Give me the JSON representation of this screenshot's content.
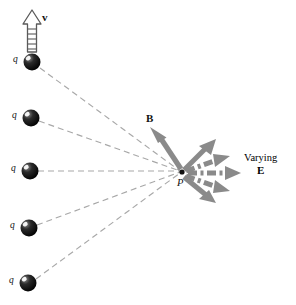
{
  "figure": {
    "title_visible": false,
    "background": "#ffffff",
    "width": 296,
    "height": 305,
    "colors": {
      "charge_fill": "#0a0a0a",
      "charge_highlight": "#ffffff",
      "dashed_line": "#a8a8a8",
      "field_arrow": "#8a8a8a",
      "b_arrow": "#8a8a8a",
      "velocity_arrow_stroke": "#555555",
      "text": "#111111"
    }
  },
  "labels": {
    "velocity": "v",
    "magnetic_field": "B",
    "point": "P",
    "varying_line1": "Varying",
    "varying_line2": "E",
    "charge": "q"
  },
  "charges": [
    {
      "label": "q",
      "cx": 32,
      "cy": 62,
      "r": 8.5,
      "label_x": 14,
      "label_y": 57
    },
    {
      "label": "q",
      "cx": 31,
      "cy": 118,
      "r": 8.5,
      "label_x": 13,
      "label_y": 113
    },
    {
      "label": "q",
      "cx": 30,
      "cy": 171,
      "r": 8.5,
      "label_x": 12,
      "label_y": 166
    },
    {
      "label": "q",
      "cx": 29,
      "cy": 228,
      "r": 8.5,
      "label_x": 11,
      "label_y": 223
    },
    {
      "label": "q",
      "cx": 28,
      "cy": 283,
      "r": 8.5,
      "label_x": 10,
      "label_y": 278
    }
  ],
  "observation_point": {
    "label": "P",
    "x": 183,
    "y": 172,
    "label_x": 178,
    "label_y": 180
  },
  "velocity_arrow": {
    "label": "v",
    "from_x": 32,
    "from_y": 55,
    "to_x": 32,
    "to_y": 12,
    "style": "hollow-dashed-outline",
    "label_x": 42,
    "label_y": 17
  },
  "b_arrow": {
    "label": "B",
    "from_x": 183,
    "from_y": 170,
    "to_x": 152,
    "to_y": 129,
    "style": "solid",
    "label_x": 147,
    "label_y": 118
  },
  "e_field_arrows": [
    {
      "angle_deg": -42,
      "length": 44,
      "style": "solid"
    },
    {
      "angle_deg": -20,
      "length": 50,
      "style": "dash-dot"
    },
    {
      "angle_deg": 0,
      "length": 72,
      "style": "dash-dot"
    },
    {
      "angle_deg": 20,
      "length": 50,
      "style": "dash-dot"
    },
    {
      "angle_deg": 42,
      "length": 44,
      "style": "solid"
    }
  ],
  "e_field_label": {
    "line1": "Varying",
    "line2": "E",
    "x": 248,
    "y": 158
  }
}
